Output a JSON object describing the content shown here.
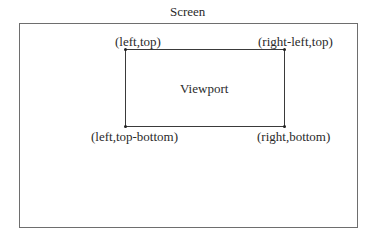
{
  "diagram": {
    "screen_label": "Screen",
    "viewport_label": "Viewport",
    "corners": {
      "top_left": "(left,top)",
      "top_right": "(right-left,top)",
      "bottom_left": "(left,top-bottom)",
      "bottom_right": "(right,bottom)"
    }
  }
}
